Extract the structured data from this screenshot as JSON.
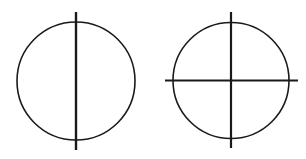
{
  "diagram": {
    "background": "#ffffff",
    "stroke_color": "#1a1a1a",
    "figures": [
      {
        "name": "circle-with-vertical-diameter",
        "circle": {
          "cx": 76,
          "cy": 81,
          "r": 59,
          "stroke_width": 1.6
        },
        "lines": [
          {
            "name": "vertical-line",
            "x1": 76,
            "y1": 12,
            "x2": 76,
            "y2": 150,
            "stroke_width": 2.4
          }
        ]
      },
      {
        "name": "circle-with-crosshair",
        "circle": {
          "cx": 231,
          "cy": 80.5,
          "r": 58,
          "stroke_width": 1.6
        },
        "lines": [
          {
            "name": "vertical-line",
            "x1": 231,
            "y1": 12,
            "x2": 231,
            "y2": 148,
            "stroke_width": 2.2
          },
          {
            "name": "horizontal-line",
            "x1": 165,
            "y1": 80.5,
            "x2": 298,
            "y2": 80.5,
            "stroke_width": 2.2
          }
        ]
      }
    ]
  }
}
